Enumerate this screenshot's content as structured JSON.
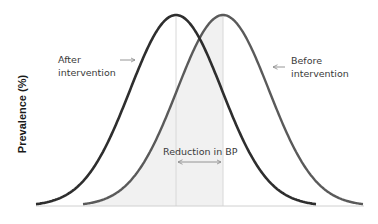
{
  "chart_data": {
    "type": "line",
    "title": "",
    "xlabel": "",
    "ylabel": "Prevalence (%)",
    "grid": false,
    "legend": "none",
    "series": [
      {
        "name": "After intervention",
        "distribution": "normal",
        "mean_px": 176,
        "sigma_px": 46,
        "start_px": 36,
        "end_px": 316,
        "color": "#2e2e2e"
      },
      {
        "name": "Before intervention",
        "distribution": "normal",
        "mean_px": 223,
        "sigma_px": 46,
        "start_px": 83,
        "end_px": 363,
        "color": "#555555"
      }
    ],
    "annotations": [
      {
        "text": "After intervention",
        "arrow": "right",
        "target": "After intervention curve"
      },
      {
        "text": "Before intervention",
        "arrow": "left",
        "target": "Before intervention curve"
      },
      {
        "text": "Reduction in BP",
        "arrow": "double-headed",
        "between": [
          "After mean",
          "Before mean"
        ]
      }
    ],
    "shaded_region": "Area under Before curve left of its mean (light grey)",
    "vertical_reference_lines": [
      "After mean",
      "Before mean"
    ]
  },
  "labels": {
    "y_axis": "Prevalence (%)",
    "after_line1": "After",
    "after_line2": "intervention",
    "before_line1": "Before",
    "before_line2": "intervention",
    "reduction": "Reduction in BP"
  },
  "colors": {
    "after_curve": "#2e2e2e",
    "before_curve": "#5a5a5a",
    "shade": "#f1f1f1",
    "ref_line": "#d6d6d6",
    "baseline": "#d0d0d0",
    "arrow": "#8a8a8a"
  }
}
